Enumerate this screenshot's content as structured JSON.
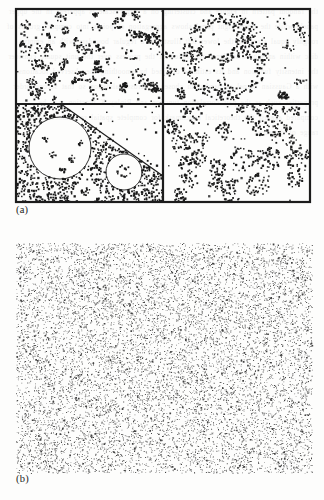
{
  "figure": {
    "kind": "scientific-figure",
    "caption_labels": {
      "panel_a": "(a)",
      "panel_b": "(b)"
    },
    "background_color": "#fdfdfc",
    "ink_color": "#1a1a1a",
    "frame_color": "#1c1c1c"
  },
  "panel_a": {
    "label": "(a)",
    "frame": {
      "x": 16,
      "y": 9,
      "width": 294,
      "height": 193,
      "stroke_width": 2.2
    },
    "divider_x": 163,
    "divider_y": 104,
    "quadrants": [
      {
        "name": "top-left",
        "description": "many small tight clusters of points scattered over whole quadrant",
        "pattern": "many-small-clusters",
        "cluster_count": 62,
        "points_per_cluster": 11,
        "cluster_radius": 4.2,
        "background_points": 70
      },
      {
        "name": "top-right",
        "description": "one large annulus of points containing three circular voids, plus small clusters at right",
        "pattern": "annulus-with-voids",
        "ring_center": [
          62,
          48
        ],
        "ring_outer_radius": 44,
        "ring_points": 430,
        "inner_voids": [
          {
            "center": [
              56,
              30
            ],
            "radius": 17
          },
          {
            "center": [
              46,
              62
            ],
            "radius": 13
          },
          {
            "center": [
              76,
              64
            ],
            "radius": 15
          }
        ],
        "side_cluster_count": 11,
        "points_per_side_cluster": 13,
        "side_cluster_radius": 5.5
      },
      {
        "name": "bottom-left",
        "description": "dense background with one large circular void and a diagonal boundary; sparse above the diagonal; small clusters inside the voids",
        "pattern": "dense-with-large-void-and-diagonal-boundary",
        "background_points": 760,
        "large_void": {
          "center": [
            44,
            44
          ],
          "radius": 31,
          "outlined": true
        },
        "small_voids": [
          {
            "center": [
              108,
              68
            ],
            "radius": 18,
            "outlined": true
          },
          {
            "center": [
              70,
              88
            ],
            "radius": 12,
            "outlined": false
          }
        ],
        "diagonal_line": {
          "x1": 45,
          "y1": 0,
          "x2": 147,
          "y2": 72
        },
        "interior_clusters": 5,
        "points_per_interior_cluster": 9
      },
      {
        "name": "bottom-right",
        "description": "medium-sized disc clusters of varying radii scattered across quadrant",
        "pattern": "scattered-discs",
        "cluster_count": 22,
        "points_per_cluster": 42,
        "cluster_radius_min": 6,
        "cluster_radius_max": 14,
        "background_points": 55
      }
    ]
  },
  "panel_b": {
    "label": "(b)",
    "region": {
      "x": 16,
      "y": 243,
      "width": 296,
      "height": 230
    },
    "description": "uniform dense homogeneous random (Poisson) point pattern filling the whole region",
    "pattern": "uniform-poisson",
    "point_count": 11000,
    "point_size": 0.85,
    "framed": false
  },
  "bleed_text": "the random pattern in Figure and clustering on a larger scale is apparent in the upper panels while the lower right panel shows aggregation of points into compact groups of roughly equal size and the lower left illustrates a regular boundary with an empty disc within an otherwise dense realisation of the process over the unit square consider the intensity function and its estimate obtained by smoothing the observed locations with a Gaussian kernel of bandwidth chosen by cross validation so that second order properties such as the pair correlation function and Ripley K function may be compared against the theoretical benchmark for complete spatial randomness across a range of distances"
}
